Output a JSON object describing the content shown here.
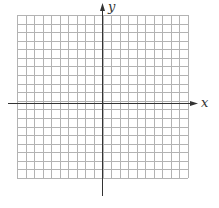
{
  "diagram": {
    "type": "coordinate-grid",
    "axes": {
      "x_label": "x",
      "y_label": "y"
    },
    "grid": {
      "cells_x": 20,
      "cells_y": 19,
      "left": 17,
      "top": 15,
      "right": 188,
      "bottom": 178,
      "line_color": "#b3b3b3",
      "axis_color": "#333333"
    },
    "origin": {
      "px": 102,
      "py": 103
    }
  }
}
